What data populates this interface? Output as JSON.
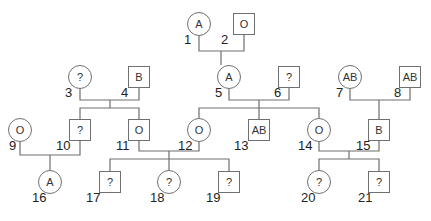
{
  "individuals": [
    {
      "id": "1",
      "sex": "female",
      "blood_type": "A"
    },
    {
      "id": "2",
      "sex": "male",
      "blood_type": "O"
    },
    {
      "id": "3",
      "sex": "female",
      "blood_type": "?"
    },
    {
      "id": "4",
      "sex": "male",
      "blood_type": "B"
    },
    {
      "id": "5",
      "sex": "female",
      "blood_type": "A"
    },
    {
      "id": "6",
      "sex": "male",
      "blood_type": "?"
    },
    {
      "id": "7",
      "sex": "female",
      "blood_type": "AB"
    },
    {
      "id": "8",
      "sex": "male",
      "blood_type": "AB"
    },
    {
      "id": "9",
      "sex": "female",
      "blood_type": "O"
    },
    {
      "id": "10",
      "sex": "male",
      "blood_type": "?"
    },
    {
      "id": "11",
      "sex": "male",
      "blood_type": "O"
    },
    {
      "id": "12",
      "sex": "female",
      "blood_type": "O"
    },
    {
      "id": "13",
      "sex": "male",
      "blood_type": "AB"
    },
    {
      "id": "14",
      "sex": "female",
      "blood_type": "O"
    },
    {
      "id": "15",
      "sex": "male",
      "blood_type": "B"
    },
    {
      "id": "16",
      "sex": "female",
      "blood_type": "A"
    },
    {
      "id": "17",
      "sex": "male",
      "blood_type": "?"
    },
    {
      "id": "18",
      "sex": "female",
      "blood_type": "?"
    },
    {
      "id": "19",
      "sex": "male",
      "blood_type": "?"
    },
    {
      "id": "20",
      "sex": "female",
      "blood_type": "?"
    },
    {
      "id": "21",
      "sex": "male",
      "blood_type": "?"
    }
  ],
  "couples": [
    {
      "parents": [
        "1",
        "2"
      ],
      "children": [
        "5"
      ]
    },
    {
      "parents": [
        "3",
        "4"
      ],
      "children": [
        "10",
        "11"
      ]
    },
    {
      "parents": [
        "5",
        "6"
      ],
      "children": [
        "12",
        "13",
        "14"
      ]
    },
    {
      "parents": [
        "7",
        "8"
      ],
      "children": [
        "15"
      ]
    },
    {
      "parents": [
        "9",
        "10"
      ],
      "children": [
        "16"
      ]
    },
    {
      "parents": [
        "11",
        "12"
      ],
      "children": [
        "17",
        "18",
        "19"
      ]
    },
    {
      "parents": [
        "14",
        "15"
      ],
      "children": [
        "20",
        "21"
      ]
    }
  ]
}
